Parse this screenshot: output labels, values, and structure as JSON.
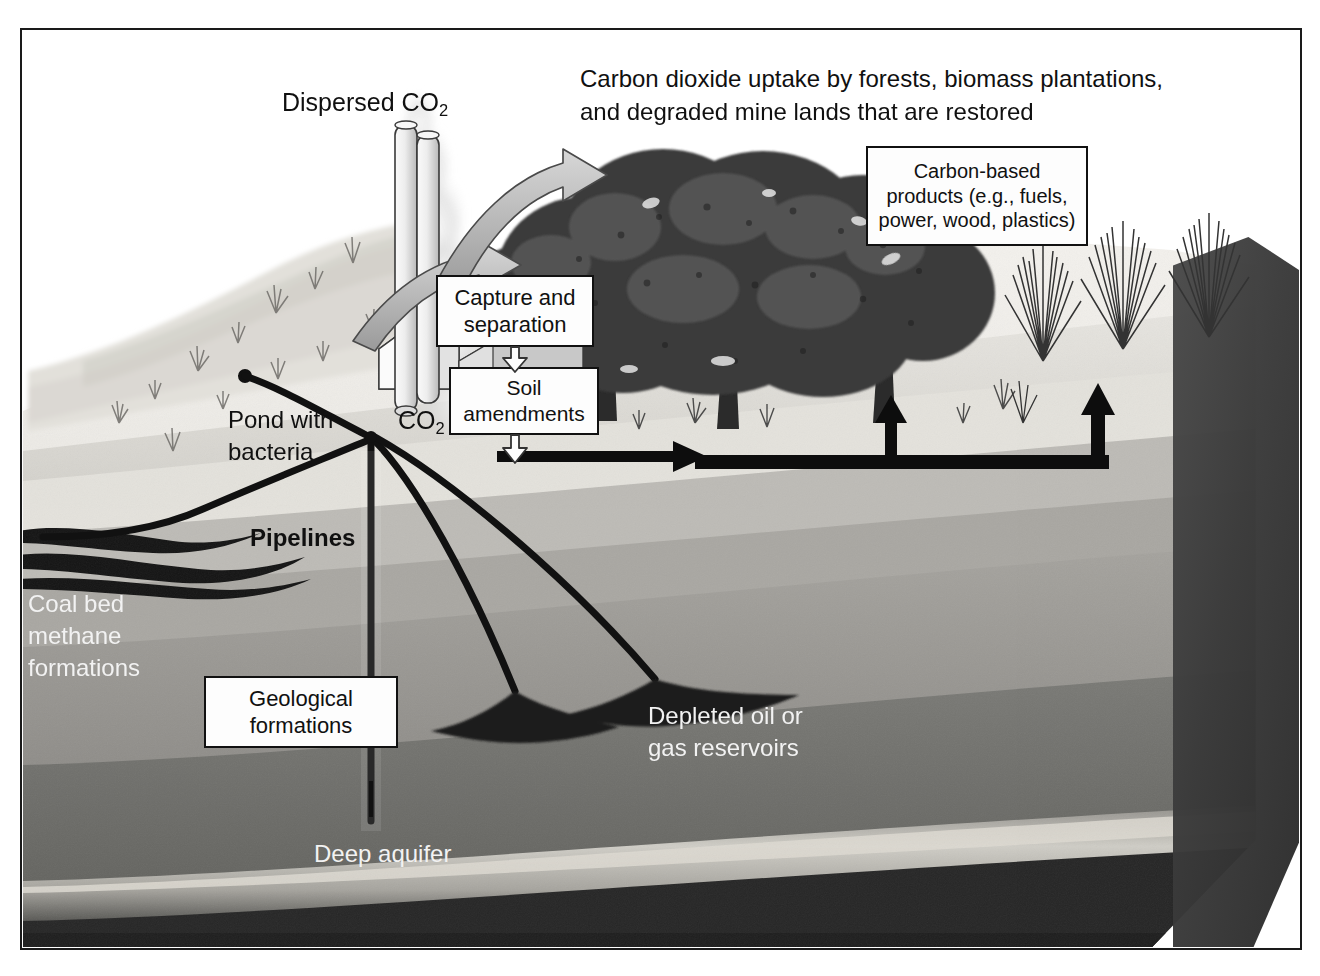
{
  "figure": {
    "domain": "diagram",
    "background_color": "#ffffff",
    "frame_color": "#1a1a1a"
  },
  "annotations": {
    "dispersed_co2": "Dispersed CO",
    "dispersed_co2_sub": "2",
    "uptake_line1": "Carbon dioxide uptake by forests, biomass plantations,",
    "uptake_line2": "and degraded mine lands that are restored",
    "co2_label": "CO",
    "co2_label_sub": "2",
    "pond_line1": "Pond with",
    "pond_line2": "bacteria",
    "pipelines": "Pipelines",
    "coal_line1": "Coal bed",
    "coal_line2": "methane",
    "coal_line3": "formations",
    "depleted_line1": "Depleted oil or",
    "depleted_line2": "gas reservoirs",
    "deep_aquifer": "Deep aquifer"
  },
  "boxes": [
    {
      "id": "carbon-based-products",
      "lines": [
        "Carbon-based",
        "products (e.g., fuels,",
        "power, wood, plastics)"
      ]
    },
    {
      "id": "capture-and-separation",
      "lines": [
        "Capture and",
        "separation"
      ]
    },
    {
      "id": "soil-amendments",
      "lines": [
        "Soil",
        "amendments"
      ]
    },
    {
      "id": "geological-formations",
      "lines": [
        "Geological",
        "formations"
      ]
    }
  ],
  "strata": [
    {
      "name": "topsoil-surface",
      "color": "#e9e7e2"
    },
    {
      "name": "shallow-sediment",
      "color": "#d5d3cd"
    },
    {
      "name": "coal-seam-band",
      "color": "#9f9d98"
    },
    {
      "name": "mid-rock",
      "color": "#8a8a86"
    },
    {
      "name": "deep-rock",
      "color": "#6d6d69"
    },
    {
      "name": "aquifer-band",
      "color": "#b9b7b1"
    },
    {
      "name": "basement-rock",
      "color": "#242424"
    }
  ],
  "colors": {
    "ink": "#101010",
    "light_text": "#f2f2f2",
    "box_fill": "#fdfdfd",
    "arrow_black": "#0d0d0d",
    "arrow_outline_fill": "#c9c9c9"
  }
}
